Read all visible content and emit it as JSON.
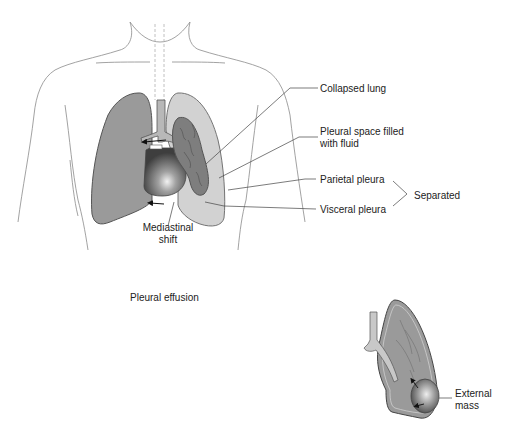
{
  "title": "Pleural effusion",
  "labels": {
    "collapsed_lung": "Collapsed lung",
    "pleural_space_line1": "Pleural space filled",
    "pleural_space_line2": "with fluid",
    "parietal_pleura": "Parietal pleura",
    "visceral_pleura": "Visceral pleura",
    "separated": "Separated",
    "mediastinal_line1": "Mediastinal",
    "mediastinal_line2": "shift",
    "external_line1": "External",
    "external_line2": "mass"
  },
  "colors": {
    "outline": "#555555",
    "lung_fill": "#9a9a9a",
    "fluid_fill": "#d2d2d2",
    "collapsed_fill": "#7e7e7e",
    "heart_fill": "#4a4a4a",
    "trachea_fill": "#b8b8b8",
    "body_line": "#8a8a8a"
  }
}
